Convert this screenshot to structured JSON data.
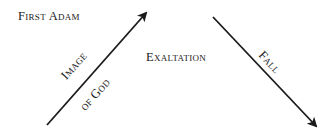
{
  "labels": {
    "first_adam": "First Adam",
    "exaltation": "Exaltation",
    "image_of_god_line1": "Image",
    "image_of_god_line2": "of God",
    "fall": "Fall"
  },
  "arrows": [
    {
      "name": "image-of-god-arrow",
      "from": [
        47,
        125
      ],
      "to": [
        147,
        12
      ],
      "direction": "up-right"
    },
    {
      "name": "fall-arrow",
      "from": [
        213,
        17
      ],
      "to": [
        317,
        127
      ],
      "direction": "down-right"
    }
  ],
  "colors": {
    "ink": "#1a1a1a",
    "background": "#ffffff"
  }
}
